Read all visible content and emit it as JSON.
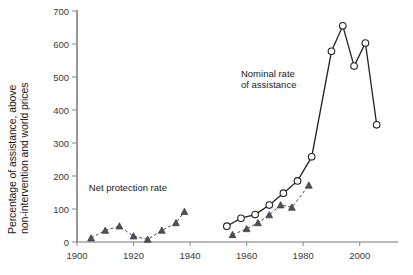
{
  "chart_data": {
    "type": "line",
    "title": "",
    "xlabel": "",
    "ylabel_line1": "Percentage of assistance, above",
    "ylabel_line2": "non-intervention and world prices",
    "xlim": [
      1900,
      2010
    ],
    "ylim": [
      0,
      700
    ],
    "xticks": [
      1900,
      1920,
      1940,
      1960,
      1980,
      2000
    ],
    "xtick_labels": [
      "1900",
      "1920",
      "1940",
      "1960",
      "1980",
      "2000"
    ],
    "yticks": [
      0,
      100,
      200,
      300,
      400,
      500,
      600,
      700
    ],
    "ytick_labels": [
      "0",
      "100",
      "200",
      "300",
      "400",
      "500",
      "600",
      "700"
    ],
    "grid": false,
    "legend_position": "inline-annotations",
    "series": [
      {
        "name": "Net protection rate",
        "marker": "triangle-filled",
        "line_style": "dashed",
        "color": "#4a4a58",
        "annotation": "Net protection rate",
        "annotation_x": 1918,
        "annotation_y": 155,
        "points": [
          {
            "x": 1905,
            "y": 12
          },
          {
            "x": 1910,
            "y": 35
          },
          {
            "x": 1915,
            "y": 48
          },
          {
            "x": 1920,
            "y": 18
          },
          {
            "x": 1925,
            "y": 8
          },
          {
            "x": 1930,
            "y": 35
          },
          {
            "x": 1935,
            "y": 58
          },
          {
            "x": 1938,
            "y": 92
          },
          {
            "x": 1955,
            "y": 22
          },
          {
            "x": 1960,
            "y": 40
          },
          {
            "x": 1964,
            "y": 58
          },
          {
            "x": 1968,
            "y": 82
          },
          {
            "x": 1972,
            "y": 112
          },
          {
            "x": 1976,
            "y": 105
          },
          {
            "x": 1982,
            "y": 172
          }
        ]
      },
      {
        "name": "Nominal rate of assistance",
        "marker": "circle-open",
        "line_style": "solid",
        "color": "#232323",
        "annotation_line1": "Nominal rate",
        "annotation_line2": "of assistance",
        "annotation_x": 1958,
        "annotation_y": 500,
        "points": [
          {
            "x": 1953,
            "y": 48
          },
          {
            "x": 1958,
            "y": 72
          },
          {
            "x": 1963,
            "y": 83
          },
          {
            "x": 1968,
            "y": 112
          },
          {
            "x": 1973,
            "y": 148
          },
          {
            "x": 1978,
            "y": 185
          },
          {
            "x": 1983,
            "y": 258
          },
          {
            "x": 1990,
            "y": 578
          },
          {
            "x": 1994,
            "y": 655
          },
          {
            "x": 1998,
            "y": 533
          },
          {
            "x": 2002,
            "y": 603
          },
          {
            "x": 2006,
            "y": 355
          }
        ]
      }
    ]
  }
}
